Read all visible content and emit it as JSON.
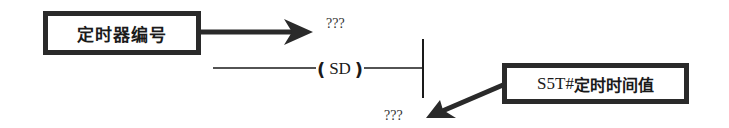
{
  "diagram": {
    "type": "ladder-logic-timer-annotation",
    "timer_number_label": "定时器编号",
    "timer_number_value": "???",
    "coil": {
      "open": "(",
      "instruction": "SD",
      "close": ")"
    },
    "time_value_label_prefix": "S5T#",
    "time_value_label_text": "定时时间值",
    "time_value_value": "???",
    "colors": {
      "line": "#1a1a1a",
      "box_border": "#2a2a2a",
      "arrow": "#2a2a2a",
      "background": "#ffffff"
    }
  }
}
